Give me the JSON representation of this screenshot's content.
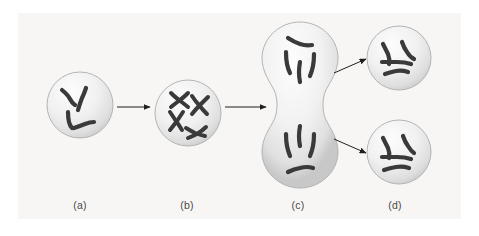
{
  "figure": {
    "panel_background": "#f7f6f4",
    "page_background": "#ffffff",
    "chromosome_color": "#3a3a3a",
    "cell_fill_light": "#fdfdfd",
    "cell_fill_mid": "#e3e3e3",
    "cell_fill_edge": "#c9c9c9",
    "cell_stroke": "#b4b4b4",
    "arrow_color": "#1f1f1f"
  },
  "labels": [
    {
      "id": "a",
      "text": "(a)",
      "x": 60,
      "y": 199
    },
    {
      "id": "b",
      "text": "(b)",
      "x": 167,
      "y": 199
    },
    {
      "id": "c",
      "text": "(c)",
      "x": 278,
      "y": 199
    },
    {
      "id": "d",
      "text": "(d)",
      "x": 375,
      "y": 199
    }
  ],
  "cells": [
    {
      "id": "cell-a",
      "stage": "a",
      "shape": "circle",
      "cx": 80,
      "cy": 105,
      "r": 33,
      "chromosome_count": 4,
      "chromosome_type": "unduplicated"
    },
    {
      "id": "cell-b",
      "stage": "b",
      "shape": "circle",
      "cx": 188,
      "cy": 113,
      "r": 33,
      "chromosome_count": 4,
      "chromosome_type": "duplicated-x-shaped"
    },
    {
      "id": "cell-c",
      "stage": "c",
      "shape": "dumbbell",
      "cx": 300,
      "cy": 105,
      "chromosome_count": 8,
      "chromosome_type": "unduplicated-separated"
    },
    {
      "id": "cell-d-top",
      "stage": "d",
      "shape": "circle",
      "cx": 399,
      "cy": 58,
      "r": 32,
      "chromosome_count": 4,
      "chromosome_type": "unduplicated"
    },
    {
      "id": "cell-d-bottom",
      "stage": "d",
      "shape": "circle",
      "cx": 399,
      "cy": 152,
      "r": 32,
      "chromosome_count": 4,
      "chromosome_type": "unduplicated"
    }
  ],
  "arrows": [
    {
      "id": "arrow-a-to-b",
      "x1": 117,
      "y1": 107,
      "x2": 152,
      "y2": 107
    },
    {
      "id": "arrow-b-to-c",
      "x1": 225,
      "y1": 107,
      "x2": 268,
      "y2": 107
    },
    {
      "id": "arrow-c-to-d-top",
      "x1": 334,
      "y1": 72,
      "x2": 368,
      "y2": 58
    },
    {
      "id": "arrow-c-to-d-bottom",
      "x1": 334,
      "y1": 140,
      "x2": 368,
      "y2": 155
    }
  ]
}
